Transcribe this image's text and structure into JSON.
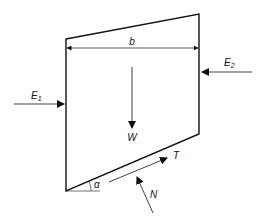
{
  "diagram": {
    "slice": {
      "top_left": [
        66,
        39
      ],
      "top_right": [
        199,
        14
      ],
      "bottom_right": [
        199,
        134
      ],
      "bottom_left": [
        66,
        191
      ]
    },
    "dimension": {
      "label": "b",
      "y": 48,
      "x1": 67,
      "x2": 198
    },
    "forces": {
      "E1": {
        "label": "E",
        "subscript": "1",
        "direction": "right",
        "from": [
          14,
          104
        ],
        "to": [
          64,
          104
        ]
      },
      "E2": {
        "label": "E",
        "subscript": "2",
        "direction": "left",
        "from": [
          252,
          72
        ],
        "to": [
          202,
          72
        ]
      },
      "W": {
        "label": "W",
        "direction": "down",
        "from": [
          132,
          67
        ],
        "to": [
          132,
          128
        ]
      },
      "T": {
        "label": "T",
        "direction": "up-slope",
        "from": [
          109,
          182
        ],
        "to": [
          167,
          158
        ]
      },
      "N": {
        "label": "N",
        "direction": "normal-to-base",
        "from": [
          153,
          213
        ],
        "to": [
          137,
          177
        ]
      }
    },
    "angle": {
      "label": "α",
      "vertex": [
        66,
        191
      ]
    }
  }
}
